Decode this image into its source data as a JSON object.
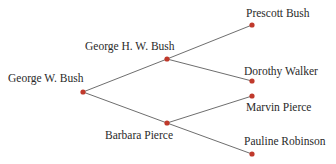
{
  "diagram": {
    "type": "family-tree",
    "colors": {
      "edge": "#6e6e6e",
      "node": "#c0392b",
      "text": "#2a2a2a"
    },
    "nodes": [
      {
        "id": "gwb",
        "label": "George W. Bush",
        "x": 83,
        "y": 92
      },
      {
        "id": "ghwb",
        "label": "George H. W. Bush",
        "x": 167,
        "y": 59
      },
      {
        "id": "bp",
        "label": "Barbara Pierce",
        "x": 167,
        "y": 123
      },
      {
        "id": "pb",
        "label": "Prescott Bush",
        "x": 252,
        "y": 25
      },
      {
        "id": "dw",
        "label": "Dorothy Walker",
        "x": 252,
        "y": 81
      },
      {
        "id": "mp",
        "label": "Marvin Pierce",
        "x": 252,
        "y": 96
      },
      {
        "id": "pr",
        "label": "Pauline Robinson",
        "x": 252,
        "y": 154
      }
    ],
    "edges": [
      [
        "gwb",
        "ghwb"
      ],
      [
        "gwb",
        "bp"
      ],
      [
        "ghwb",
        "pb"
      ],
      [
        "ghwb",
        "dw"
      ],
      [
        "bp",
        "mp"
      ],
      [
        "bp",
        "pr"
      ]
    ]
  }
}
